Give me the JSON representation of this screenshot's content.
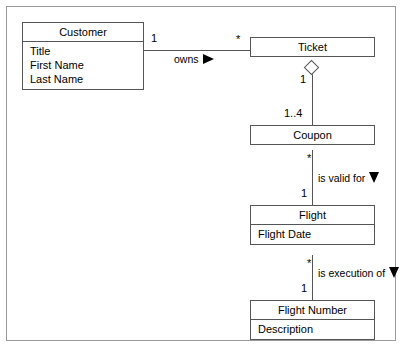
{
  "diagram": {
    "type": "uml-class-diagram",
    "classes": [
      {
        "id": "customer",
        "name": "Customer",
        "attributes": [
          "Title",
          "First Name",
          "Last Name"
        ]
      },
      {
        "id": "ticket",
        "name": "Ticket",
        "attributes": []
      },
      {
        "id": "coupon",
        "name": "Coupon",
        "attributes": []
      },
      {
        "id": "flight",
        "name": "Flight",
        "attributes": [
          "Flight Date"
        ]
      },
      {
        "id": "flight_number",
        "name": "Flight Number",
        "attributes": [
          "Description"
        ]
      }
    ],
    "associations": [
      {
        "id": "customer_owns_ticket",
        "label": "owns",
        "direction_marker": "triangle-right",
        "source": "Customer",
        "target": "Ticket",
        "source_multiplicity": "1",
        "target_multiplicity": "*",
        "kind": "association"
      },
      {
        "id": "ticket_aggregates_coupon",
        "label": "",
        "direction_marker": "",
        "source": "Ticket",
        "target": "Coupon",
        "source_multiplicity": "1",
        "target_multiplicity": "1..4",
        "kind": "aggregation",
        "diamond": "hollow"
      },
      {
        "id": "coupon_is_valid_for_flight",
        "label": "is valid for",
        "direction_marker": "triangle-down",
        "source": "Coupon",
        "target": "Flight",
        "source_multiplicity": "*",
        "target_multiplicity": "1",
        "kind": "association"
      },
      {
        "id": "flight_is_execution_of_flight_number",
        "label": "is execution of",
        "direction_marker": "triangle-down",
        "source": "Flight",
        "target": "Flight Number",
        "source_multiplicity": "*",
        "target_multiplicity": "1",
        "kind": "association"
      }
    ],
    "colors": {
      "box_border": "#555555",
      "box_fill": "#ffffff",
      "line": "#555555",
      "frame_border": "#9a9a9a",
      "text": "#000000",
      "marker_fill": "#000000"
    }
  }
}
